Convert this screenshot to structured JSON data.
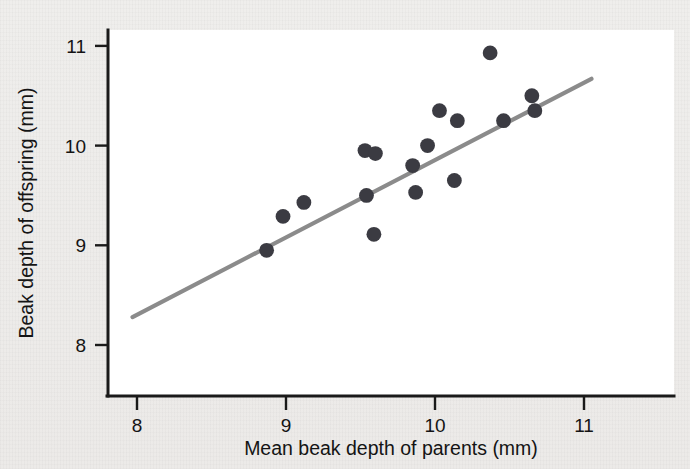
{
  "chart_data": {
    "type": "scatter",
    "title": "",
    "xlabel": "Mean beak depth of parents (mm)",
    "ylabel": "Beak depth of offspring (mm)",
    "xlim": [
      7.8,
      11.6
    ],
    "ylim": [
      7.6,
      11.3
    ],
    "xticks": [
      "8",
      "9",
      "10",
      "11"
    ],
    "xtick_values": [
      8,
      9,
      10,
      11
    ],
    "yticks": [
      "8",
      "9",
      "10",
      "11"
    ],
    "ytick_values": [
      8,
      9,
      10,
      11
    ],
    "grid": false,
    "legend": false,
    "point_color": "#3b3b42",
    "line_color": "#8b8b8b",
    "background_color": "#ffffff",
    "page_color": "#efeeec",
    "points": [
      {
        "x": 8.87,
        "y": 8.95
      },
      {
        "x": 8.98,
        "y": 9.29
      },
      {
        "x": 9.12,
        "y": 9.43
      },
      {
        "x": 9.54,
        "y": 9.5
      },
      {
        "x": 9.53,
        "y": 9.95
      },
      {
        "x": 9.6,
        "y": 9.92
      },
      {
        "x": 9.59,
        "y": 9.11
      },
      {
        "x": 9.87,
        "y": 9.53
      },
      {
        "x": 9.85,
        "y": 9.8
      },
      {
        "x": 9.95,
        "y": 10.0
      },
      {
        "x": 10.03,
        "y": 10.35
      },
      {
        "x": 10.15,
        "y": 10.25
      },
      {
        "x": 10.13,
        "y": 9.65
      },
      {
        "x": 10.37,
        "y": 10.93
      },
      {
        "x": 10.46,
        "y": 10.25
      },
      {
        "x": 10.65,
        "y": 10.5
      },
      {
        "x": 10.67,
        "y": 10.35
      }
    ],
    "fit_line": {
      "x0": 7.97,
      "y0": 8.28,
      "x1": 11.05,
      "y1": 10.67
    }
  }
}
